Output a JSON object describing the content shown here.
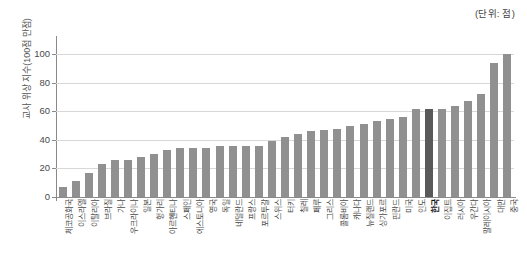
{
  "unit_note": "(단위: 점)",
  "y_axis_title": "교사 위상 지수(100점 만점)",
  "highlight_country": "한국",
  "colors": {
    "bar": "#909090",
    "bar_highlight": "#595959",
    "grid": "#d8d8d8",
    "axis": "#8a8a8a",
    "text": "#4a4a4a"
  },
  "chart_data": {
    "type": "bar",
    "title": "",
    "subtitle": "",
    "xlabel": "",
    "ylabel": "교사 위상 지수(100점 만점)",
    "unit": "점",
    "ylim": [
      0,
      110
    ],
    "yticks": [
      0,
      20,
      40,
      60,
      80,
      100
    ],
    "grid": true,
    "legend": "none",
    "highlight": "한국",
    "categories": [
      "체코공화국",
      "이스라엘",
      "이탈리아",
      "브라질",
      "가나",
      "우크라이나",
      "일본",
      "헝가리",
      "아르헨티나",
      "스페인",
      "에스토니아",
      "영국",
      "독일",
      "네덜란드",
      "프랑스",
      "포르투갈",
      "스위스",
      "터키",
      "칠레",
      "페루",
      "그리스",
      "콜롬비아",
      "캐나다",
      "뉴질랜드",
      "싱가포르",
      "핀란드",
      "미국",
      "인도",
      "한국",
      "이집트",
      "러시아",
      "우간다",
      "말레이시아",
      "대만",
      "중국"
    ],
    "values": [
      7,
      11,
      17,
      23,
      26,
      26,
      28,
      30,
      33,
      34,
      34,
      34,
      36,
      36,
      36,
      36,
      39,
      42,
      44,
      46,
      47,
      48,
      50,
      51,
      53,
      55,
      56,
      62,
      62,
      62,
      64,
      67,
      72,
      94,
      100
    ],
    "series": [
      {
        "name": "교사 위상 지수",
        "values": [
          7,
          11,
          17,
          23,
          26,
          26,
          28,
          30,
          33,
          34,
          34,
          34,
          36,
          36,
          36,
          36,
          39,
          42,
          44,
          46,
          47,
          48,
          50,
          51,
          53,
          55,
          56,
          62,
          62,
          62,
          64,
          67,
          72,
          94,
          100
        ]
      }
    ]
  }
}
